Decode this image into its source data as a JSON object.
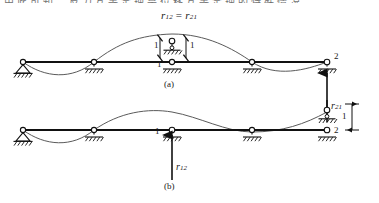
{
  "figure": {
    "top_cut_text": "由此可知，反力互等定理是位移互等定理的特殊情况",
    "equation": {
      "left_symbol": "r",
      "left_sub": "12",
      "relation": "=",
      "right_symbol": "r",
      "right_sub": "21"
    },
    "diagrams": [
      {
        "id": "a",
        "caption": "(a)",
        "description": "Continuous beam on five supports with unit vertical displacement applied at support 1; reaction r21 develops at support 2",
        "unit_displacement_label": "1",
        "dimension_labels": [
          "1",
          "1",
          "1"
        ],
        "node_labels": [
          {
            "name": "node-1-label",
            "text": "1"
          },
          {
            "name": "node-2-label",
            "text": "2"
          }
        ],
        "reaction": {
          "symbol": "r",
          "sub": "21",
          "direction": "up",
          "at_node": "2"
        }
      },
      {
        "id": "b",
        "caption": "(b)",
        "description": "Same continuous beam with unit vertical displacement applied at support 2; reaction r12 develops at support 1",
        "unit_displacement_label": "1",
        "dimension_labels": [
          "1"
        ],
        "node_labels": [
          {
            "name": "node-1-label",
            "text": "1"
          },
          {
            "name": "node-2-label",
            "text": "2"
          }
        ],
        "reaction": {
          "symbol": "r",
          "sub": "12",
          "direction": "up",
          "at_node": "1"
        }
      }
    ],
    "colors": {
      "line": "#1a1a1a",
      "beam": "#111111",
      "deflection": "#555555",
      "background": "#ffffff"
    }
  }
}
